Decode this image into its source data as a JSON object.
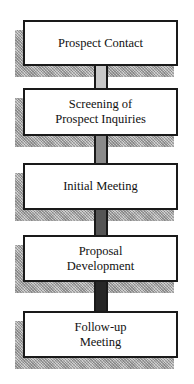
{
  "diagram": {
    "type": "vertical-flowchart",
    "steps": [
      {
        "label": "Prospect Contact"
      },
      {
        "label": "Screening of\nProspect Inquiries"
      },
      {
        "label": "Initial Meeting"
      },
      {
        "label": "Proposal\nDevelopment"
      },
      {
        "label": "Follow-up\nMeeting"
      }
    ],
    "connectors": [
      {
        "from": 0,
        "to": 1,
        "fill": "#c8c8c8"
      },
      {
        "from": 1,
        "to": 2,
        "fill": "#8a8a8a"
      },
      {
        "from": 2,
        "to": 3,
        "fill": "#555555"
      },
      {
        "from": 3,
        "to": 4,
        "fill": "#262626"
      }
    ]
  }
}
